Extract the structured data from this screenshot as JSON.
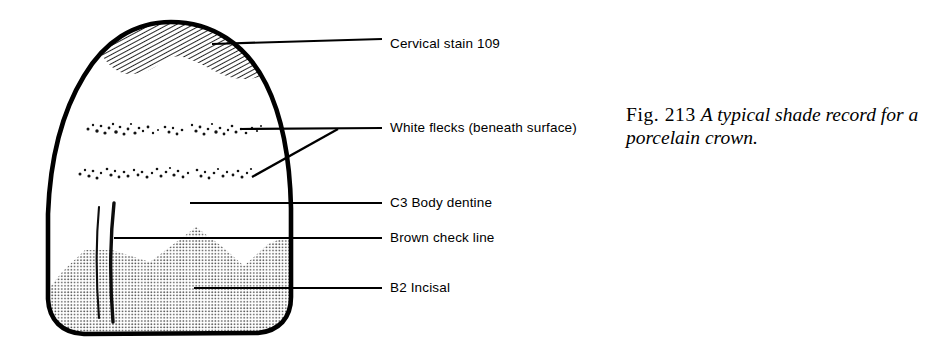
{
  "figure": {
    "width": 948,
    "height": 363,
    "background_color": "#ffffff",
    "ink_color": "#000000",
    "stipple_color": "#6e6e6e"
  },
  "caption": {
    "figure_number": "Fig. 213",
    "description": "A typical shade record for a porcelain crown."
  },
  "callouts": [
    {
      "id": "cervical-stain",
      "label": "Cervical stain 109",
      "text_x": 390,
      "text_y": 44,
      "leader": {
        "x1": 212,
        "y1": 44,
        "x2": 382,
        "y2": 39
      }
    },
    {
      "id": "white-flecks",
      "label": "White flecks (beneath surface)",
      "text_x": 390,
      "text_y": 128,
      "leader": {
        "x1": 240,
        "y1": 129,
        "x2": 382,
        "y2": 128
      },
      "leader2": {
        "x1": 252,
        "y1": 176,
        "x2": 336,
        "y2": 130
      }
    },
    {
      "id": "c3-body-dentine",
      "label": "C3 Body dentine",
      "text_x": 390,
      "text_y": 203,
      "leader": {
        "x1": 190,
        "y1": 203,
        "x2": 382,
        "y2": 203
      }
    },
    {
      "id": "brown-check-line",
      "label": "Brown check line",
      "text_x": 390,
      "text_y": 238,
      "leader": {
        "x1": 114,
        "y1": 238,
        "x2": 382,
        "y2": 238
      }
    },
    {
      "id": "b2-incisal",
      "label": "B2 Incisal",
      "text_x": 390,
      "text_y": 288,
      "leader": {
        "x1": 194,
        "y1": 288,
        "x2": 382,
        "y2": 288
      }
    }
  ],
  "tooth": {
    "outline_stroke_width": 4.5,
    "bounds": {
      "left": 47,
      "top": 22,
      "right": 292,
      "bottom": 335
    },
    "regions": [
      {
        "name": "cervical-stain-hatched-band",
        "fill": "diagonal-hatch"
      },
      {
        "name": "body-dentine-area",
        "fill": "white"
      },
      {
        "name": "incisal-stipple-area",
        "fill": "dot-screen"
      },
      {
        "name": "white-fleck-row-upper",
        "fill": "speckle"
      },
      {
        "name": "white-fleck-row-lower",
        "fill": "speckle"
      },
      {
        "name": "brown-check-lines",
        "fill": "solid-strokes",
        "count": 2
      }
    ]
  }
}
